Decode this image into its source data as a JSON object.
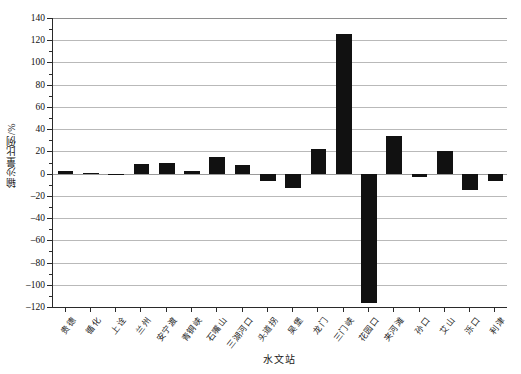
{
  "chart_data": {
    "type": "bar",
    "title": "",
    "xlabel": "水文站",
    "ylabel": "输沙量比例/%",
    "ylim": [
      -120,
      140
    ],
    "ytick_step": 20,
    "grid": true,
    "legend": "none",
    "bar_color": "#111111",
    "categories": [
      "贵德",
      "循化",
      "上诠",
      "兰州",
      "安宁渡",
      "青铜峡",
      "石嘴山",
      "三湖河口",
      "头道拐",
      "吴堡",
      "龙门",
      "三门峡",
      "花园口",
      "夹河滩",
      "孙口",
      "艾山",
      "泺口",
      "利津"
    ],
    "values": [
      2,
      0.5,
      -1.5,
      9,
      9.5,
      2.5,
      15,
      8,
      -7,
      -13,
      22,
      126,
      -116,
      34,
      -3,
      20.5,
      -15,
      -7
    ],
    "yticks": [
      140,
      120,
      100,
      80,
      60,
      40,
      20,
      0,
      -20,
      -40,
      -60,
      -80,
      -100,
      -120
    ],
    "ytick_labels": [
      "140",
      "120",
      "100",
      "80",
      "60",
      "40",
      "20",
      "0",
      "-20",
      "-40",
      "-60",
      "-80",
      "-100",
      "-120"
    ]
  }
}
